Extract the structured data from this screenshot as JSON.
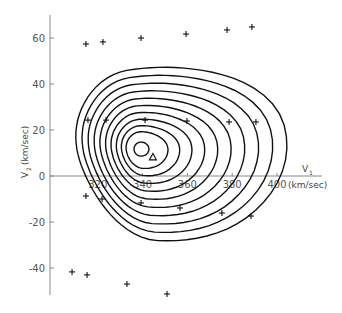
{
  "chart_data": {
    "type": "scatter",
    "title": "",
    "xlabel": "V1 (km/sec)",
    "ylabel": "V2 (km/sec)",
    "x_axis": {
      "label_main": "V",
      "label_sub": "1",
      "unit": "(km/sec)",
      "ticks": [
        320,
        340,
        360,
        380,
        400
      ],
      "range": [
        300,
        420
      ]
    },
    "y_axis": {
      "label_main": "V",
      "label_sub": "2",
      "unit": "(km/sec)",
      "ticks": [
        60,
        40,
        20,
        0,
        -20,
        -40
      ],
      "range": [
        -55,
        70
      ]
    },
    "grid": false,
    "legend": null,
    "series": [
      {
        "name": "grid points",
        "marker": "plus",
        "points": [
          [
            314.7,
            57.4
          ],
          [
            322.3,
            58.3
          ],
          [
            339.3,
            60.0
          ],
          [
            359.4,
            61.7
          ],
          [
            377.7,
            63.5
          ],
          [
            388.8,
            64.8
          ],
          [
            315.6,
            24.3
          ],
          [
            323.7,
            24.3
          ],
          [
            341.1,
            24.3
          ],
          [
            359.8,
            23.9
          ],
          [
            378.6,
            23.5
          ],
          [
            390.6,
            23.5
          ],
          [
            314.7,
            -8.7
          ],
          [
            321.9,
            -10.0
          ],
          [
            339.3,
            -11.7
          ],
          [
            356.7,
            -13.9
          ],
          [
            375.4,
            -16.1
          ],
          [
            388.4,
            -17.4
          ],
          [
            308.5,
            -41.7
          ],
          [
            315.2,
            -43.0
          ],
          [
            333.0,
            -47.0
          ],
          [
            350.9,
            -51.3
          ]
        ]
      },
      {
        "name": "minimum",
        "marker": "circle",
        "points": [
          [
            339.3,
            11.7
          ]
        ]
      },
      {
        "name": "reference point",
        "marker": "triangle",
        "points": [
          [
            344.6,
            8.3
          ]
        ]
      }
    ],
    "contours": {
      "count": 11,
      "center": [
        339.3,
        11.7
      ],
      "description": "Nested closed contour levels around the minimum, skewed toward higher V1 and lower V2"
    }
  }
}
